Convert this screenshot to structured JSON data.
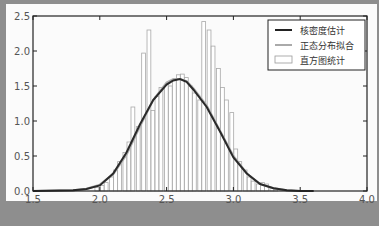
{
  "chart_data": {
    "type": "bar",
    "title": "",
    "xlabel": "",
    "ylabel": "",
    "xlim": [
      1.5,
      4.0
    ],
    "ylim": [
      0.0,
      2.5
    ],
    "xticks": [
      "1.5",
      "2.0",
      "2.5",
      "3.0",
      "3.5",
      "4.0"
    ],
    "yticks": [
      "0.0",
      "0.5",
      "1.0",
      "1.5",
      "2.0",
      "2.5"
    ],
    "grid": false,
    "legend_position": "upper right",
    "legend": [
      {
        "label": "核密度估计",
        "style": "line",
        "color": "#222222"
      },
      {
        "label": "正态分布拟合",
        "style": "line",
        "color": "#aaaaaa"
      },
      {
        "label": "直方图统计",
        "style": "bar",
        "color": "#ffffff"
      }
    ],
    "series": [
      {
        "name": "直方图统计",
        "type": "bar",
        "bin_width": 0.033,
        "x": [
          1.98,
          2.02,
          2.05,
          2.09,
          2.12,
          2.15,
          2.19,
          2.22,
          2.25,
          2.29,
          2.33,
          2.37,
          2.4,
          2.43,
          2.46,
          2.5,
          2.53,
          2.56,
          2.59,
          2.62,
          2.65,
          2.68,
          2.71,
          2.75,
          2.78,
          2.82,
          2.85,
          2.89,
          2.92,
          2.95,
          2.99,
          3.02,
          3.05,
          3.09,
          3.12,
          3.15,
          3.19,
          3.22,
          3.25,
          3.29,
          3.32
        ],
        "values": [
          0.05,
          0.08,
          0.12,
          0.2,
          0.3,
          0.42,
          0.55,
          0.7,
          1.2,
          0.92,
          1.97,
          2.3,
          1.15,
          1.35,
          1.48,
          1.52,
          1.5,
          1.58,
          1.66,
          1.67,
          1.62,
          1.5,
          1.4,
          1.3,
          2.42,
          2.3,
          2.07,
          1.75,
          1.48,
          1.3,
          1.12,
          0.6,
          0.42,
          0.3,
          0.2,
          0.14,
          0.1,
          0.12,
          0.1,
          0.05,
          0.03
        ]
      },
      {
        "name": "核密度估计",
        "type": "line",
        "x": [
          1.5,
          1.8,
          1.9,
          2.0,
          2.1,
          2.2,
          2.3,
          2.4,
          2.5,
          2.55,
          2.6,
          2.65,
          2.7,
          2.8,
          2.9,
          3.0,
          3.1,
          3.2,
          3.3,
          3.4,
          3.5,
          3.6
        ],
        "values": [
          0.0,
          0.01,
          0.03,
          0.08,
          0.25,
          0.55,
          0.95,
          1.3,
          1.52,
          1.58,
          1.6,
          1.56,
          1.45,
          1.2,
          0.85,
          0.48,
          0.25,
          0.1,
          0.04,
          0.01,
          0.0,
          0.0
        ]
      },
      {
        "name": "正态分布拟合",
        "type": "line",
        "x": [
          1.5,
          1.8,
          1.9,
          2.0,
          2.1,
          2.2,
          2.3,
          2.4,
          2.5,
          2.55,
          2.6,
          2.65,
          2.7,
          2.8,
          2.9,
          3.0,
          3.1,
          3.2,
          3.3,
          3.4,
          3.5,
          3.6
        ],
        "values": [
          0.0,
          0.01,
          0.03,
          0.09,
          0.24,
          0.52,
          0.92,
          1.3,
          1.55,
          1.6,
          1.6,
          1.57,
          1.47,
          1.22,
          0.86,
          0.5,
          0.25,
          0.1,
          0.04,
          0.01,
          0.0,
          0.0
        ]
      }
    ]
  },
  "legend": {
    "items": [
      "核密度估计",
      "正态分布拟合",
      "直方图统计"
    ]
  },
  "axis": {
    "x_ticks": [
      "1.5",
      "2.0",
      "2.5",
      "3.0",
      "3.5",
      "4.0"
    ],
    "y_ticks": [
      "0.0",
      "0.5",
      "1.0",
      "1.5",
      "2.0",
      "2.5"
    ]
  }
}
